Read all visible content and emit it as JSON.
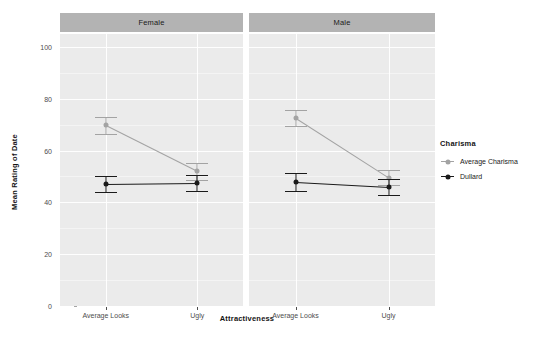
{
  "chart_data": {
    "type": "line",
    "title": "",
    "xlabel": "Attractiveness",
    "ylabel": "Mean Rating of Date",
    "ylim": [
      0,
      105
    ],
    "yticks": [
      0,
      20,
      40,
      60,
      80,
      100
    ],
    "ytick_labels": [
      "0",
      "20",
      "40",
      "60",
      "80",
      "100"
    ],
    "grid": true,
    "categories": [
      "Average Looks",
      "Ugly"
    ],
    "facet_label": "gender",
    "facets": [
      {
        "name": "Female",
        "series": [
          {
            "name": "Average Charisma",
            "color": "#a3a3a3",
            "values": [
              69.7,
              52.0
            ],
            "err_low": [
              66.4,
              48.7
            ],
            "err_high": [
              72.8,
              55.1
            ]
          },
          {
            "name": "Dullard",
            "color": "#1a1a1a",
            "values": [
              47.0,
              47.4
            ],
            "err_low": [
              44.0,
              44.3
            ],
            "err_high": [
              50.0,
              50.4
            ]
          }
        ]
      },
      {
        "name": "Male",
        "series": [
          {
            "name": "Average Charisma",
            "color": "#a3a3a3",
            "values": [
              72.6,
              49.6
            ],
            "err_low": [
              69.6,
              46.6
            ],
            "err_high": [
              75.5,
              52.5
            ]
          },
          {
            "name": "Dullard",
            "color": "#1a1a1a",
            "values": [
              47.9,
              46.0
            ],
            "err_low": [
              44.3,
              42.9
            ],
            "err_high": [
              51.5,
              49.1
            ]
          }
        ]
      }
    ],
    "legend": {
      "title": "Charisma",
      "position": "right",
      "entries": [
        {
          "label": "Average Charisma",
          "color": "#a3a3a3"
        },
        {
          "label": "Dullard",
          "color": "#1a1a1a"
        }
      ]
    },
    "colors": {
      "panel_background": "#ebebeb",
      "strip_background": "#b3b3b3",
      "gridline": "#ffffff",
      "plot_background": "#ffffff",
      "axis_text": "#4d4d4d",
      "title_text": "#141414"
    }
  }
}
